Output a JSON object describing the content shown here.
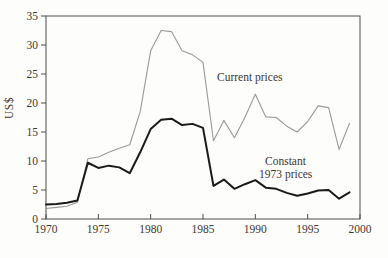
{
  "figure": {
    "y_axis_label": "US$",
    "annotations": {
      "current": "Current prices",
      "constant_line1": "Constant",
      "constant_line2": "1973 prices"
    }
  },
  "colors": {
    "background": "#fdfdfb",
    "frame": "#4d4d4d",
    "tick_text": "#3e3731",
    "current_line": "#999999",
    "constant_line": "#1a1a1a"
  },
  "chart_data": {
    "type": "line",
    "title": "",
    "xlabel": "",
    "ylabel": "US$",
    "xlim": [
      1970,
      2000
    ],
    "ylim": [
      0,
      35
    ],
    "xticks": [
      1970,
      1975,
      1980,
      1985,
      1990,
      1995,
      2000
    ],
    "yticks": [
      0,
      5,
      10,
      15,
      20,
      25,
      30,
      35
    ],
    "grid": false,
    "legend_position": "inline-annotations",
    "x": [
      1970,
      1971,
      1972,
      1973,
      1974,
      1975,
      1976,
      1977,
      1978,
      1979,
      1980,
      1981,
      1982,
      1983,
      1984,
      1985,
      1986,
      1987,
      1988,
      1989,
      1990,
      1991,
      1992,
      1993,
      1994,
      1995,
      1996,
      1997,
      1998,
      1999
    ],
    "series": [
      {
        "name": "Current prices",
        "color": "#999999",
        "stroke_width": 1.1,
        "values": [
          1.8,
          2.0,
          2.2,
          2.9,
          10.4,
          10.7,
          11.5,
          12.2,
          12.8,
          18.5,
          29.0,
          32.5,
          32.3,
          29.0,
          28.3,
          27.0,
          13.5,
          17.0,
          14.0,
          17.5,
          21.5,
          17.6,
          17.5,
          16.0,
          15.0,
          16.8,
          19.5,
          19.2,
          12.0,
          16.5
        ]
      },
      {
        "name": "Constant 1973 prices",
        "color": "#1a1a1a",
        "stroke_width": 2,
        "values": [
          2.5,
          2.6,
          2.8,
          3.2,
          9.7,
          8.8,
          9.2,
          8.9,
          7.9,
          11.5,
          15.5,
          17.1,
          17.3,
          16.2,
          16.4,
          15.7,
          5.7,
          6.8,
          5.2,
          6.0,
          6.7,
          5.4,
          5.2,
          4.5,
          4.0,
          4.4,
          4.9,
          5.0,
          3.5,
          4.6
        ]
      }
    ]
  }
}
